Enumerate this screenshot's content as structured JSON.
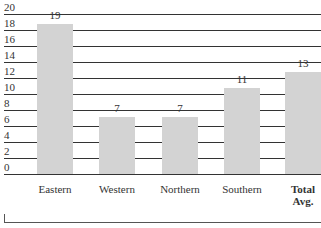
{
  "chart_data": {
    "type": "bar",
    "title": "",
    "xlabel": "",
    "ylabel": "",
    "categories": [
      "Eastern",
      "Western",
      "Northern",
      "Southern",
      "Total Avg."
    ],
    "values": [
      19,
      7,
      7,
      11,
      13
    ],
    "data_labels": [
      "19",
      "7",
      "7",
      "11",
      "13"
    ],
    "ylim": [
      0,
      20
    ],
    "yticks": [
      "20",
      "18",
      "16",
      "14",
      "12",
      "10",
      "8",
      "6",
      "4",
      "2",
      "0"
    ],
    "grid": true,
    "legend": null,
    "bar_color": "#d3d3d3",
    "emphasized_category": "Total Avg."
  }
}
